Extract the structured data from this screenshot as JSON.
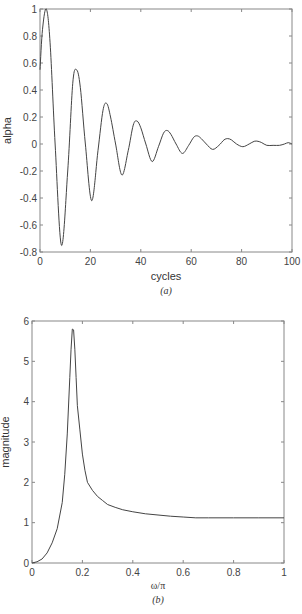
{
  "chart_data": [
    {
      "id": "a",
      "type": "line",
      "caption": "(a)",
      "title": "",
      "xlabel": "cycles",
      "ylabel": "alpha",
      "xlim": [
        0,
        100
      ],
      "ylim": [
        -0.8,
        1
      ],
      "xticks": [
        0,
        20,
        40,
        60,
        80,
        100
      ],
      "xtick_labels": [
        "0",
        "20",
        "40",
        "60",
        "80",
        "100"
      ],
      "yticks": [
        -0.8,
        -0.6,
        -0.4,
        -0.2,
        0,
        0.2,
        0.4,
        0.6,
        0.8,
        1
      ],
      "ytick_labels": [
        "-0.8",
        "-0.6",
        "-0.4",
        "-0.2",
        "0",
        "0.2",
        "0.4",
        "0.6",
        "0.8",
        "1"
      ],
      "grid": false,
      "legend": null,
      "series": [
        {
          "name": "alpha",
          "x": [
            0,
            1,
            2.5,
            4,
            6,
            8.5,
            11,
            13,
            14.5,
            16,
            18,
            20.5,
            23,
            25,
            26.5,
            28,
            30,
            32.5,
            35,
            37,
            38.5,
            40,
            42,
            44.5,
            47,
            49,
            50.5,
            52,
            54,
            56.5,
            59,
            61,
            62.5,
            64,
            66,
            68.5,
            71,
            73,
            74.5,
            76,
            78,
            80.5,
            83,
            85,
            86.5,
            88,
            90,
            92.5,
            95,
            97,
            98.5,
            100
          ],
          "values": [
            0.55,
            0.85,
            1.0,
            0.75,
            0.0,
            -0.75,
            -0.2,
            0.45,
            0.55,
            0.42,
            0.0,
            -0.42,
            -0.05,
            0.25,
            0.3,
            0.2,
            0.0,
            -0.23,
            -0.05,
            0.14,
            0.17,
            0.12,
            0.0,
            -0.13,
            -0.02,
            0.08,
            0.1,
            0.07,
            0.0,
            -0.07,
            -0.01,
            0.05,
            0.06,
            0.04,
            0.0,
            -0.04,
            -0.01,
            0.03,
            0.04,
            0.03,
            0.0,
            -0.02,
            0.0,
            0.02,
            0.02,
            0.01,
            -0.01,
            -0.01,
            -0.01,
            0.0,
            0.01,
            0.0
          ]
        }
      ]
    },
    {
      "id": "b",
      "type": "line",
      "caption": "(b)",
      "title": "",
      "xlabel": "ω/π",
      "ylabel": "magnitude",
      "xlim": [
        0,
        1
      ],
      "ylim": [
        0,
        6
      ],
      "xticks": [
        0,
        0.2,
        0.4,
        0.6,
        0.8,
        1
      ],
      "xtick_labels": [
        "0",
        "0.2",
        "0.4",
        "0.6",
        "0.8",
        "1"
      ],
      "yticks": [
        0,
        1,
        2,
        3,
        4,
        5,
        6
      ],
      "ytick_labels": [
        "0",
        "1",
        "2",
        "3",
        "4",
        "5",
        "6"
      ],
      "grid": false,
      "legend": null,
      "series": [
        {
          "name": "magnitude",
          "x": [
            0,
            0.02,
            0.04,
            0.06,
            0.08,
            0.1,
            0.12,
            0.13,
            0.14,
            0.15,
            0.155,
            0.16,
            0.165,
            0.17,
            0.175,
            0.18,
            0.19,
            0.2,
            0.21,
            0.22,
            0.24,
            0.26,
            0.28,
            0.3,
            0.33,
            0.36,
            0.4,
            0.45,
            0.5,
            0.55,
            0.6,
            0.65,
            0.7,
            0.8,
            0.9,
            1.0
          ],
          "values": [
            0.0,
            0.03,
            0.1,
            0.25,
            0.5,
            0.85,
            1.5,
            2.2,
            3.2,
            4.6,
            5.3,
            5.8,
            5.78,
            5.3,
            4.6,
            3.9,
            3.3,
            2.7,
            2.3,
            2.0,
            1.8,
            1.65,
            1.55,
            1.45,
            1.38,
            1.32,
            1.27,
            1.22,
            1.19,
            1.16,
            1.14,
            1.12,
            1.12,
            1.12,
            1.12,
            1.12
          ]
        }
      ]
    }
  ]
}
